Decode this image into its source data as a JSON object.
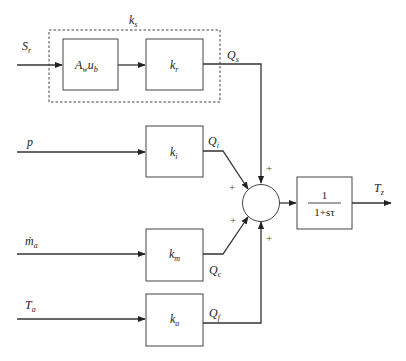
{
  "diagram": {
    "group_label": {
      "main": "k",
      "sub": "s"
    },
    "inputs": [
      {
        "id": "Sr",
        "main": "S",
        "sub": "r",
        "y": 65
      },
      {
        "id": "p",
        "main": "p",
        "sub": "",
        "y": 152
      },
      {
        "id": "ma",
        "main": "ṁ",
        "sub": "a",
        "y": 254
      },
      {
        "id": "Ta",
        "main": "T",
        "sub": "a",
        "y": 319
      }
    ],
    "blocks": {
      "awub": {
        "main": "A",
        "sub1": "w",
        "main2": "u",
        "sub2": "b"
      },
      "kr": {
        "main": "k",
        "sub": "r"
      },
      "ki": {
        "main": "k",
        "sub": "i"
      },
      "km": {
        "main": "k",
        "sub": "m"
      },
      "ka": {
        "main": "k",
        "sub": "a"
      },
      "transfer": {
        "numerator": "1",
        "denominator": "1+sτ"
      }
    },
    "signals": {
      "Qs": {
        "main": "Q",
        "sub": "s"
      },
      "Qi": {
        "main": "Q",
        "sub": "i"
      },
      "Qc": {
        "main": "Q",
        "sub": "c"
      },
      "Qf": {
        "main": "Q",
        "sub": "f"
      }
    },
    "summer_signs": [
      "+",
      "+",
      "+",
      "+"
    ],
    "output": {
      "main": "T",
      "sub": "z"
    }
  }
}
